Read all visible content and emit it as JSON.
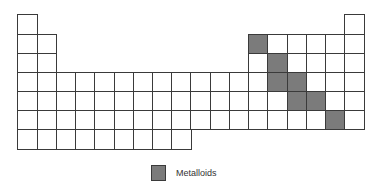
{
  "diagram": {
    "columns": 18,
    "rows": 7,
    "colors": {
      "metalloid": "#7b7b7b",
      "empty": "#ffffff",
      "border": "#3a3a3a"
    },
    "row_layout": [
      {
        "period": 1,
        "columns": [
          1,
          18
        ]
      },
      {
        "period": 2,
        "columns": [
          1,
          2,
          13,
          14,
          15,
          16,
          17,
          18
        ]
      },
      {
        "period": 3,
        "columns": [
          1,
          2,
          13,
          14,
          15,
          16,
          17,
          18
        ]
      },
      {
        "period": 4,
        "columns": [
          1,
          2,
          3,
          4,
          5,
          6,
          7,
          8,
          9,
          10,
          11,
          12,
          13,
          14,
          15,
          16,
          17,
          18
        ]
      },
      {
        "period": 5,
        "columns": [
          1,
          2,
          3,
          4,
          5,
          6,
          7,
          8,
          9,
          10,
          11,
          12,
          13,
          14,
          15,
          16,
          17,
          18
        ]
      },
      {
        "period": 6,
        "columns": [
          1,
          2,
          3,
          4,
          5,
          6,
          7,
          8,
          9,
          10,
          11,
          12,
          13,
          14,
          15,
          16,
          17,
          18
        ]
      },
      {
        "period": 7,
        "columns": [
          1,
          2,
          3,
          4,
          5,
          6,
          7,
          8,
          9
        ]
      }
    ],
    "metalloid_cells": [
      {
        "period": 2,
        "column": 13
      },
      {
        "period": 3,
        "column": 14
      },
      {
        "period": 4,
        "column": 14
      },
      {
        "period": 4,
        "column": 15
      },
      {
        "period": 5,
        "column": 15
      },
      {
        "period": 5,
        "column": 16
      },
      {
        "period": 6,
        "column": 17
      }
    ]
  },
  "legend": {
    "items": [
      {
        "label": "Metalloids",
        "color": "#7b7b7b"
      }
    ]
  }
}
